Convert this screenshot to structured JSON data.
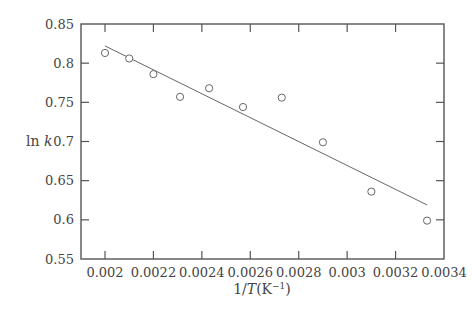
{
  "chart_data": {
    "type": "scatter",
    "title": "",
    "xlabel": "1/T(K⁻¹)",
    "xlabel_parts": {
      "prefix": "1/",
      "var": "T",
      "suffix": "(K",
      "sup": "−1",
      "close": ")"
    },
    "ylabel": "ln k",
    "ylabel_parts": {
      "fn": "ln",
      "var": "k"
    },
    "xlim": [
      0.00185,
      0.0034
    ],
    "ylim": [
      0.55,
      0.85
    ],
    "grid": false,
    "legend": null,
    "x_ticks": [
      0.002,
      0.0022,
      0.0024,
      0.0026,
      0.0028,
      0.003,
      0.0032,
      0.0034
    ],
    "x_tick_labels": [
      "0.002",
      "0.0022",
      "0.0024",
      "0.0026",
      "0.0028",
      "0.003",
      "0.0032",
      "0.0034"
    ],
    "y_ticks": [
      0.55,
      0.6,
      0.65,
      0.7,
      0.75,
      0.8,
      0.85
    ],
    "y_tick_labels": [
      "0.55",
      "0.6",
      "0.65",
      "0.7",
      "0.75",
      "0.8",
      "0.85"
    ],
    "series": [
      {
        "name": "data",
        "marker": "open-circle",
        "x": [
          0.002,
          0.0021,
          0.0022,
          0.00231,
          0.00243,
          0.00257,
          0.00273,
          0.0029,
          0.0031,
          0.00333
        ],
        "y": [
          0.813,
          0.806,
          0.786,
          0.757,
          0.768,
          0.744,
          0.756,
          0.699,
          0.636,
          0.599
        ]
      },
      {
        "name": "linear fit",
        "marker": "line",
        "x": [
          0.002,
          0.00333
        ],
        "y": [
          0.822,
          0.619
        ]
      }
    ]
  },
  "colors": {
    "axis": "#555555",
    "marker": "#666666",
    "fit_line": "#666666",
    "text": "#444444"
  }
}
